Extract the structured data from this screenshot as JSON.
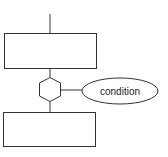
{
  "diagram": {
    "type": "flowchart",
    "nodes": [
      {
        "id": "box_top",
        "shape": "rectangle",
        "label": ""
      },
      {
        "id": "hex",
        "shape": "hexagon",
        "label": ""
      },
      {
        "id": "condition",
        "shape": "ellipse",
        "label": "condition"
      },
      {
        "id": "box_bottom",
        "shape": "rectangle",
        "label": ""
      }
    ],
    "edges": [
      {
        "from": "entry",
        "to": "box_top"
      },
      {
        "from": "box_top",
        "to": "hex"
      },
      {
        "from": "hex",
        "to": "condition"
      },
      {
        "from": "hex",
        "to": "box_bottom"
      }
    ],
    "colors": {
      "stroke": "#333333",
      "fill": "#ffffff",
      "text": "#222222"
    }
  }
}
